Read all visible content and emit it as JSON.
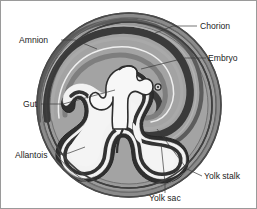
{
  "figure": {
    "name": "amniote-egg-embryo-cross-section",
    "background_color": "#ffffff",
    "frame_color": "#9a9a9a"
  },
  "palette": {
    "outer_shell_gray": "#8f8f8f",
    "mid_gray": "#a4a4a4",
    "inner_fill_gray": "#a0a0a0",
    "dark_membrane": "#3b3b3b",
    "darker_line": "#2a2a2a",
    "light_cavity": "#eeeeee",
    "white_cavity": "#f7f7f7",
    "label_text": "#1c1c1c",
    "leader_line": "#3a3a3a"
  },
  "labels": [
    {
      "id": "chorion",
      "text": "Chorion",
      "text_x": 199,
      "text_y": 28,
      "anchor": "start",
      "leader": "M196,25 L170,25 L150,32"
    },
    {
      "id": "amnion",
      "text": "Amnion",
      "text_x": 18,
      "text_y": 42,
      "anchor": "start",
      "leader": "M58,39 L72,39 L92,46"
    },
    {
      "id": "embryo",
      "text": "Embryo",
      "text_x": 207,
      "text_y": 60,
      "anchor": "start",
      "leader": "M205,57 L186,57 L148,66"
    },
    {
      "id": "gut",
      "text": "Gut",
      "text_x": 22,
      "text_y": 106,
      "anchor": "start",
      "leader": "M38,103 L60,103 L112,88"
    },
    {
      "id": "allantois",
      "text": "Allantois",
      "text_x": 14,
      "text_y": 157,
      "anchor": "start",
      "leader": "M55,154 L66,152 L80,148"
    },
    {
      "id": "yolk-stalk",
      "text": "Yolk stalk",
      "text_x": 203,
      "text_y": 178,
      "anchor": "start",
      "leader": "M201,175 L188,170 L158,130"
    },
    {
      "id": "yolk-sac",
      "text": "Yolk sac",
      "text_x": 148,
      "text_y": 200,
      "anchor": "start",
      "leader": "M163,192 L163,182 L160,140"
    }
  ],
  "structures": [
    {
      "id": "shell-outer-ring",
      "name": "chorion-outer-shell"
    },
    {
      "id": "chorion-band",
      "name": "chorion-membrane-band"
    },
    {
      "id": "amnion-fold",
      "name": "amnion-fold"
    },
    {
      "id": "amniotic-cavity",
      "name": "amniotic-cavity"
    },
    {
      "id": "embryo-body",
      "name": "embryo-body"
    },
    {
      "id": "embryo-eye",
      "name": "embryo-eye-dot"
    },
    {
      "id": "gut-tube",
      "name": "gut-tube"
    },
    {
      "id": "allantois-sac",
      "name": "allantois-cavity"
    },
    {
      "id": "yolk-sac-cavity",
      "name": "yolk-sac-cavity"
    },
    {
      "id": "yolk-stalk-neck",
      "name": "yolk-stalk-neck"
    }
  ]
}
